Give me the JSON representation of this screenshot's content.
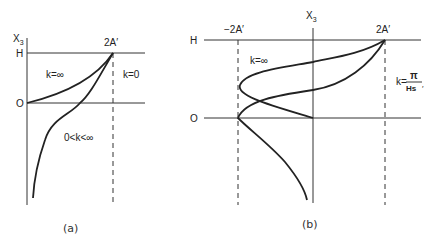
{
  "panel_a": {
    "axis_label": "X",
    "axis_subscript": "3",
    "h_label": "H",
    "o_label": "O",
    "apex_label": "2A′",
    "curve_labels": {
      "k_inf": "k=∞",
      "k_zero": "k=0",
      "k_mid": "0<k<∞"
    },
    "caption": "(a)"
  },
  "panel_b": {
    "axis_label": "X",
    "axis_subscript": "3",
    "h_label": "H",
    "o_label": "O",
    "left_label": "−2A′",
    "right_label": "2A′",
    "curve_labels": {
      "k_inf": "k=∞",
      "k_frac_prefix": "k=",
      "k_frac_num": "π",
      "k_frac_den": "Hs",
      "k_frac_suffix": "′"
    },
    "caption": "(b)"
  }
}
